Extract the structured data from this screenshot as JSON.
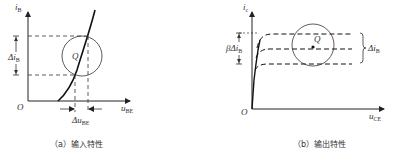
{
  "panels": [
    {
      "id": "a",
      "caption": "（a）输入特性",
      "y_axis_label": "i",
      "y_axis_sub": "B",
      "x_axis_label": "u",
      "x_axis_sub": "BE",
      "origin_label": "O",
      "point_label": "Q",
      "delta_y_label": "Δi",
      "delta_y_sub": "B",
      "delta_x_label": "Δu",
      "delta_x_sub": "BE"
    },
    {
      "id": "b",
      "caption": "（b）输出特性",
      "y_axis_label": "i",
      "y_axis_sub": "c",
      "x_axis_label": "u",
      "x_axis_sub": "CE",
      "origin_label": "O",
      "point_label": "Q",
      "delta_y_label": "βΔi",
      "delta_y_sub": "B",
      "bracket_label": "Δi",
      "bracket_sub": "B"
    }
  ],
  "colors": {
    "line": "#222222",
    "background": "#ffffff"
  }
}
